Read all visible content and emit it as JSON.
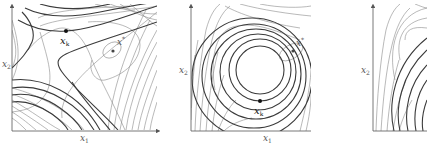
{
  "figure": {
    "panels": [
      {
        "id": "left",
        "axes": {
          "x_label": "x",
          "x_sub": "1",
          "y_label": "x",
          "y_sub": "2"
        },
        "points": [
          {
            "name": "xk",
            "label": "x",
            "sub": "k",
            "color": "#111111"
          },
          {
            "name": "xstar",
            "label": "x",
            "sup": "*",
            "color": "#444444"
          }
        ]
      },
      {
        "id": "middle",
        "axes": {
          "x_label": "x",
          "x_sub": "1",
          "y_label": "x",
          "y_sub": "2"
        },
        "points": [
          {
            "name": "xk",
            "label": "x",
            "sub": "k",
            "color": "#111111"
          },
          {
            "name": "xstar",
            "label": "x",
            "sup": "*",
            "color": "#444444"
          }
        ]
      },
      {
        "id": "right",
        "axes": {
          "y_label": "x",
          "y_sub": "2"
        }
      }
    ],
    "colors": {
      "thin_contour": "#8a8a8a",
      "thick_contour": "#3a3a3a",
      "axis": "#555555"
    }
  }
}
